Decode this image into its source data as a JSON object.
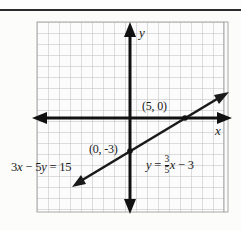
{
  "figure": {
    "title_rule": true,
    "background_color": "#fdfdfd",
    "grid": {
      "columns": 17,
      "rows": 17,
      "cell_px": 11,
      "line_color": "#b9b9b9",
      "border_color": "#9a9a9a",
      "left_px": 37,
      "top_px": 22,
      "right_px": 228,
      "bottom_px": 212
    },
    "axes": {
      "color": "#111111",
      "x_axis_label": "x",
      "y_axis_label": "y",
      "origin_px": {
        "x": 130,
        "y": 118
      },
      "units_per_cell": 1,
      "x_range": [
        -8,
        9
      ],
      "y_range": [
        -8,
        9
      ]
    },
    "line": {
      "color": "#1a1a1a",
      "slope": 0.6,
      "y_intercept": -3,
      "x_intercept": 5,
      "double_arrow": true
    },
    "points": [
      {
        "name": "x-intercept",
        "label": "(5, 0)",
        "x": 5,
        "y": 0,
        "marked": true
      },
      {
        "name": "y-intercept",
        "label": "(0, -3)",
        "x": 0,
        "y": -3,
        "marked": true
      }
    ],
    "equations": {
      "standard_form": {
        "coef_x": "3",
        "var_x": "x",
        "operator": "−",
        "coef_y": "5",
        "var_y": "y",
        "equals": "=",
        "constant": "15",
        "full": "3x − 5y = 15"
      },
      "slope_intercept_form": {
        "var_y": "y",
        "equals": "=",
        "slope_numerator": "3",
        "slope_denominator": "5",
        "var_x": "x",
        "operator": "−",
        "constant": "3",
        "full": "y = 3/5 x − 3"
      }
    }
  }
}
